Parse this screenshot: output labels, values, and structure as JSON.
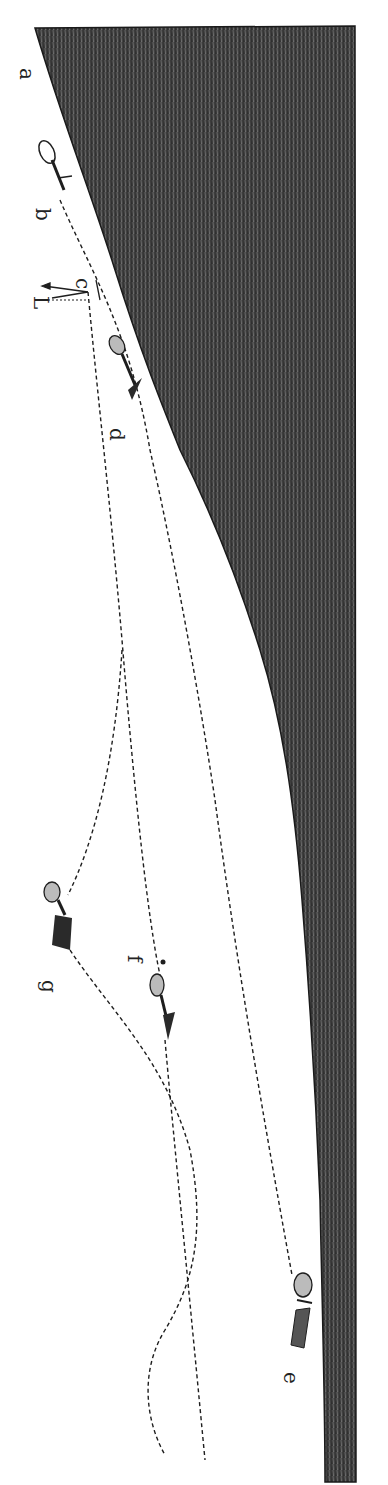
{
  "figure": {
    "colors": {
      "ground": "#2e2e2e",
      "ground_texture": "#8a8a8a",
      "ink": "#1e1e1e",
      "paper": "#ffffff"
    },
    "labels": {
      "a": "a",
      "b": "b",
      "c": "c",
      "L": "L",
      "d": "d",
      "e": "e",
      "f": "f",
      "g": "g"
    },
    "seeds": [
      {
        "id": "b",
        "name": "seed-b"
      },
      {
        "id": "d",
        "name": "seed-d"
      },
      {
        "id": "e",
        "name": "seed-e"
      },
      {
        "id": "f",
        "name": "seed-f"
      },
      {
        "id": "g",
        "name": "seed-g"
      }
    ]
  }
}
